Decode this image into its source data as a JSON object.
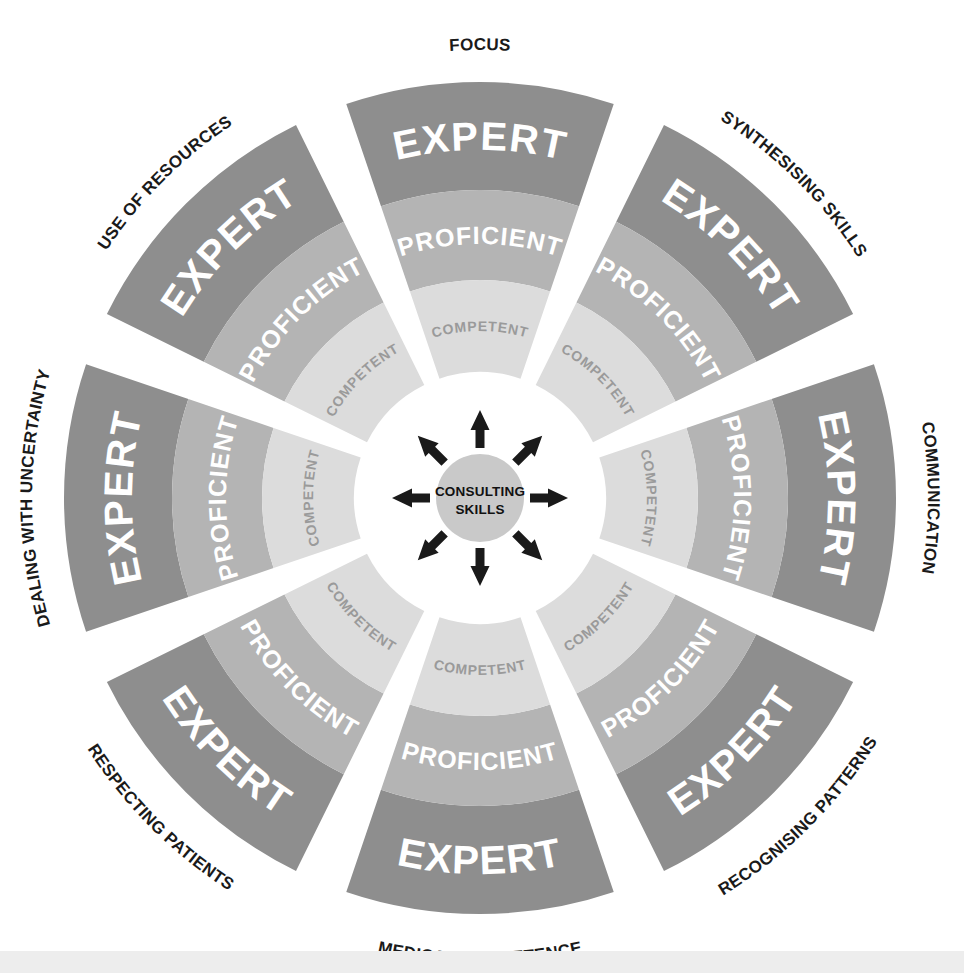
{
  "diagram": {
    "hub": {
      "line1": "CONSULTING",
      "line2": "SKILLS"
    },
    "levels": [
      {
        "key": "expert",
        "label": "EXPERT",
        "color": "#8e8e8e",
        "text_color": "#ffffff",
        "r_inner": 308,
        "r_outer": 416
      },
      {
        "key": "proficient",
        "label": "PROFICIENT",
        "color": "#b4b4b4",
        "text_color": "#ffffff",
        "r_inner": 218,
        "r_outer": 308
      },
      {
        "key": "competent",
        "label": "COMPETENT",
        "color": "#dcdcdc",
        "text_color": "#9a9a9a",
        "r_inner": 126,
        "r_outer": 218
      }
    ],
    "segments": [
      {
        "index": 0,
        "label": "FOCUS",
        "angle_deg": 270
      },
      {
        "index": 1,
        "label": "SYNTHESISING SKILLS",
        "angle_deg": 315
      },
      {
        "index": 2,
        "label": "COMMUNICATION",
        "angle_deg": 0
      },
      {
        "index": 3,
        "label": "RECOGNISING PATTERNS",
        "angle_deg": 45
      },
      {
        "index": 4,
        "label": "MEDICAL COMPETENCE",
        "angle_deg": 90
      },
      {
        "index": 5,
        "label": "RESPECTING PATIENTS",
        "angle_deg": 135
      },
      {
        "index": 6,
        "label": "DEALING WITH UNCERTAINTY",
        "angle_deg": 180
      },
      {
        "index": 7,
        "label": "USE OF RESOURCES",
        "angle_deg": 225
      }
    ],
    "geometry": {
      "center_x": 480,
      "center_y": 498,
      "segment_count": 8,
      "segment_span_deg": 37.5,
      "gap_deg": 7.5,
      "hub_radius": 44,
      "arrow_count": 8,
      "outer_label_radius": 448
    },
    "colors": {
      "background": "#ffffff",
      "expert": "#8e8e8e",
      "proficient": "#b4b4b4",
      "competent": "#dcdcdc",
      "hub_fill": "#c9c9c9",
      "arrow": "#1a1a1a",
      "outer_label": "#1a1a1a",
      "bottom_band": "#ededed"
    }
  }
}
